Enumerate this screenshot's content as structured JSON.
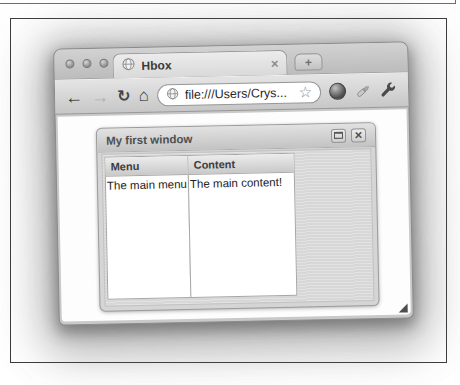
{
  "browser_tab": {
    "title": "Hbox",
    "close_glyph": "×",
    "new_tab_glyph": "+"
  },
  "toolbar": {
    "back_glyph": "←",
    "forward_glyph": "→",
    "reload_glyph": "↻",
    "home_glyph": "⌂",
    "address_value": "file:///Users/Crys...",
    "bookmark_star_glyph": "☆"
  },
  "ext_window": {
    "title": "My first window",
    "close_glyph": "×",
    "panels": [
      {
        "header": "Menu",
        "body": "The main menu"
      },
      {
        "header": "Content",
        "body": "The main content!"
      }
    ]
  },
  "colors": {
    "chrome_gray": "#c7c7c7",
    "window_body_gray": "#d7d7d7",
    "text_dark": "#333333",
    "frame_border": "#3c3c3c"
  }
}
